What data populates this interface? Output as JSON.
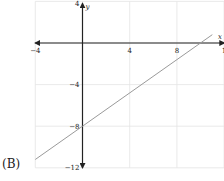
{
  "choice_label": "(B)",
  "chart_data": {
    "type": "line",
    "title": "",
    "xlabel": "x",
    "ylabel": "y",
    "xlim": [
      -4,
      12
    ],
    "ylim": [
      -12,
      4
    ],
    "x_ticks": [
      -4,
      4,
      8,
      12
    ],
    "x_tick_labels": [
      "−4",
      "4",
      "8",
      "1"
    ],
    "y_ticks": [
      4,
      -4,
      -8,
      -12
    ],
    "y_tick_labels": [
      "4",
      "−4",
      "−8",
      "−12"
    ],
    "grid": true,
    "grid_spacing": 4,
    "series": [
      {
        "name": "line",
        "equation": "y = 0.8x - 8",
        "slope": 0.8,
        "intercept": -8,
        "x": [
          -4,
          11
        ],
        "y": [
          -11.2,
          0.8
        ]
      }
    ],
    "colors": {
      "grid": "#e4e4e4",
      "axis": "#222222",
      "line": "#9a9a9a"
    }
  }
}
